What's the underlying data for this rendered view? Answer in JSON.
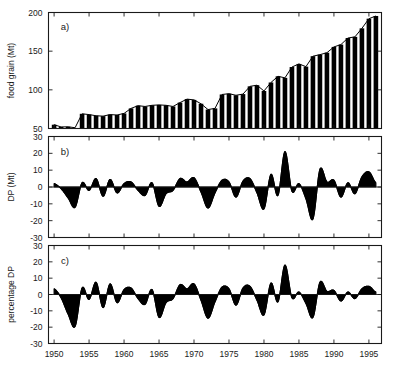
{
  "figure": {
    "title": "",
    "panels": [
      {
        "tag": "a)",
        "ylabel": "food grain (Mt)"
      },
      {
        "tag": "b)",
        "ylabel": "DP (Mt)"
      },
      {
        "tag": "c)",
        "ylabel": "percentage DP"
      }
    ],
    "xticklabels": [
      "1950",
      "1955",
      "1960",
      "1965",
      "1970",
      "1975",
      "1980",
      "1985",
      "1990",
      "1995"
    ]
  },
  "chart_data": [
    {
      "type": "bar",
      "title": "",
      "panel": "a)",
      "xlabel": "",
      "ylabel": "food grain (Mt)",
      "xlim": [
        1949.2,
        1996.8
      ],
      "ylim": [
        50,
        200
      ],
      "yticks": [
        50,
        100,
        150,
        200
      ],
      "xticks": [
        1950,
        1955,
        1960,
        1965,
        1970,
        1975,
        1980,
        1985,
        1990,
        1995
      ],
      "grid": false,
      "legend": null,
      "categories": [
        1950,
        1951,
        1952,
        1953,
        1954,
        1955,
        1956,
        1957,
        1958,
        1959,
        1960,
        1961,
        1962,
        1963,
        1964,
        1965,
        1966,
        1967,
        1968,
        1969,
        1970,
        1971,
        1972,
        1973,
        1974,
        1975,
        1976,
        1977,
        1978,
        1979,
        1980,
        1981,
        1982,
        1983,
        1984,
        1985,
        1986,
        1987,
        1988,
        1989,
        1990,
        1991,
        1992,
        1993,
        1994,
        1995,
        1996
      ],
      "values": [
        54.9,
        52.0,
        52.2,
        51.0,
        69.0,
        68.0,
        66.5,
        66.0,
        68.0,
        67.5,
        69.5,
        76.0,
        79.5,
        78.5,
        80.0,
        80.5,
        80.0,
        78.5,
        83.5,
        88.0,
        87.0,
        82.0,
        74.5,
        76.0,
        94.0,
        95.0,
        93.0,
        94.5,
        104.5,
        106.0,
        98.5,
        109.5,
        117.5,
        115.5,
        129.5,
        133.5,
        130.0,
        143.5,
        145.5,
        148.0,
        155.5,
        158.5,
        167.0,
        168.5,
        179.5,
        192.0,
        195.5
      ]
    },
    {
      "type": "area",
      "panel": "b)",
      "title": "",
      "xlabel": "",
      "ylabel": "DP (Mt)",
      "xlim": [
        1949.2,
        1996.8
      ],
      "ylim": [
        -30,
        30
      ],
      "yticks": [
        -30,
        -20,
        -10,
        0,
        10,
        20,
        30
      ],
      "xticks": [
        1950,
        1955,
        1960,
        1965,
        1970,
        1975,
        1980,
        1985,
        1990,
        1995
      ],
      "grid": false,
      "legend": null,
      "x": [
        1950,
        1951,
        1952,
        1953,
        1954,
        1955,
        1956,
        1957,
        1958,
        1959,
        1960,
        1961,
        1962,
        1963,
        1964,
        1965,
        1966,
        1967,
        1968,
        1969,
        1970,
        1971,
        1972,
        1973,
        1974,
        1975,
        1976,
        1977,
        1978,
        1979,
        1980,
        1981,
        1982,
        1983,
        1984,
        1985,
        1986,
        1987,
        1988,
        1989,
        1990,
        1991,
        1992,
        1993,
        1994,
        1995,
        1996
      ],
      "values": [
        2.0,
        -1.0,
        -6.5,
        -12.0,
        2.5,
        -2.0,
        5.0,
        -5.5,
        4.5,
        -3.5,
        2.0,
        3.0,
        -2.0,
        -5.0,
        2.5,
        -11.5,
        -4.0,
        -2.0,
        5.0,
        3.0,
        5.5,
        -3.0,
        -12.5,
        -3.5,
        4.0,
        3.0,
        -6.0,
        3.5,
        5.0,
        -3.5,
        -13.0,
        7.5,
        -5.0,
        21.0,
        -2.5,
        2.0,
        -7.0,
        -19.0,
        10.5,
        3.0,
        4.0,
        -6.0,
        2.5,
        -4.0,
        6.0,
        9.0,
        2.5
      ]
    },
    {
      "type": "area",
      "panel": "c)",
      "title": "",
      "xlabel": "",
      "ylabel": "percentage DP",
      "xlim": [
        1949.2,
        1996.8
      ],
      "ylim": [
        -30,
        30
      ],
      "yticks": [
        -30,
        -20,
        -10,
        0,
        10,
        20,
        30
      ],
      "xticks": [
        1950,
        1955,
        1960,
        1965,
        1970,
        1975,
        1980,
        1985,
        1990,
        1995
      ],
      "grid": false,
      "legend": null,
      "x": [
        1950,
        1951,
        1952,
        1953,
        1954,
        1955,
        1956,
        1957,
        1958,
        1959,
        1960,
        1961,
        1962,
        1963,
        1964,
        1965,
        1966,
        1967,
        1968,
        1969,
        1970,
        1971,
        1972,
        1973,
        1974,
        1975,
        1976,
        1977,
        1978,
        1979,
        1980,
        1981,
        1982,
        1983,
        1984,
        1985,
        1986,
        1987,
        1988,
        1989,
        1990,
        1991,
        1992,
        1993,
        1994,
        1995,
        1996
      ],
      "values": [
        3.5,
        -2.0,
        -12.0,
        -19.5,
        4.0,
        -3.0,
        7.5,
        -8.0,
        6.5,
        -5.0,
        3.0,
        4.0,
        -2.5,
        -6.0,
        3.0,
        -14.0,
        -5.0,
        -2.5,
        6.0,
        3.5,
        6.5,
        -3.5,
        -14.5,
        -4.5,
        4.5,
        3.5,
        -6.5,
        4.0,
        5.0,
        -3.5,
        -12.5,
        7.0,
        -4.5,
        18.0,
        -2.0,
        1.5,
        -5.5,
        -14.0,
        7.5,
        2.0,
        2.5,
        -4.0,
        1.5,
        -2.5,
        3.5,
        5.0,
        1.5
      ]
    }
  ]
}
